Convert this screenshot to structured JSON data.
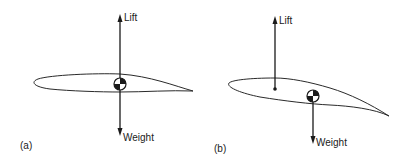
{
  "panels": [
    {
      "id": "a",
      "caption": "(a)",
      "lift_label": "Lift",
      "weight_label": "Weight",
      "description": "Lift and weight act through the same point (center of gravity)"
    },
    {
      "id": "b",
      "caption": "(b)",
      "lift_label": "Lift",
      "weight_label": "Weight",
      "description": "Lift acts forward of the center of gravity"
    }
  ],
  "colors": {
    "stroke": "#1a1a1a",
    "background": "#ffffff"
  }
}
